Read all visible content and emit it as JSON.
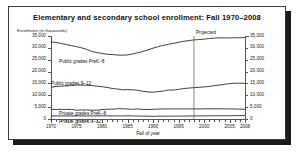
{
  "chart_data": {
    "type": "line",
    "title": "Elementary and secondary school enrollment: Fall 1970–2008",
    "ylabel": "Enrollment (in thousands)",
    "xlabel": "Fall of year",
    "xlim": [
      1970,
      2008
    ],
    "ylim": [
      0,
      35000
    ],
    "grid": false,
    "legend_position": "inline-labels",
    "dual_y_axis": true,
    "y_ticks": [
      0,
      5000,
      10000,
      15000,
      20000,
      25000,
      30000,
      35000
    ],
    "y_tick_labels": [
      "0",
      "5,000",
      "10,000",
      "15,000",
      "20,000",
      "25,000",
      "30,000",
      "35,000"
    ],
    "x_ticks": [
      1970,
      1975,
      1980,
      1985,
      1990,
      1995,
      2000,
      2005,
      2008
    ],
    "x_tick_labels": [
      "1970",
      "1975",
      "1980",
      "1985",
      "1990",
      "1995",
      "2000",
      "2005",
      "2008"
    ],
    "x_minor_tick_step": 1,
    "annotations": [
      {
        "name": "projected-divider",
        "label": "Projected",
        "x": 1998,
        "type": "vertical-line-with-label"
      }
    ],
    "x": [
      1970,
      1971,
      1972,
      1973,
      1974,
      1975,
      1976,
      1977,
      1978,
      1979,
      1980,
      1981,
      1982,
      1983,
      1984,
      1985,
      1986,
      1987,
      1988,
      1989,
      1990,
      1991,
      1992,
      1993,
      1994,
      1995,
      1996,
      1997,
      1998,
      1999,
      2000,
      2001,
      2002,
      2003,
      2004,
      2005,
      2006,
      2007,
      2008
    ],
    "series": [
      {
        "name": "Public grades PreK–8",
        "label": "Public grades PreK–8",
        "values": [
          32577,
          32265,
          31879,
          31401,
          30971,
          30515,
          29997,
          29375,
          28463,
          28034,
          27647,
          27280,
          27161,
          26981,
          26905,
          27034,
          27420,
          27933,
          28501,
          29152,
          29878,
          30506,
          31088,
          31504,
          31898,
          32341,
          32764,
          33073,
          33344,
          33486,
          33686,
          33936,
          34114,
          34201,
          34178,
          34204,
          34235,
          34286,
          34350
        ]
      },
      {
        "name": "Public grades 9–12",
        "label": "Public grades 9–12",
        "values": [
          13332,
          13753,
          13848,
          14002,
          14103,
          14304,
          14314,
          14203,
          14088,
          13855,
          13616,
          13298,
          12880,
          12639,
          12304,
          12388,
          12333,
          12076,
          11687,
          11390,
          11338,
          11541,
          11735,
          12213,
          12213,
          12500,
          12849,
          13054,
          13195,
          13369,
          13517,
          13736,
          14069,
          14338,
          14618,
          14909,
          15081,
          15086,
          15047
        ]
      },
      {
        "name": "Private grades PreK–8",
        "label": "Private grades PreK–8",
        "values": [
          4052,
          4052,
          4048,
          4045,
          4042,
          3700,
          3825,
          3797,
          3732,
          3700,
          3992,
          4100,
          4165,
          4315,
          4339,
          4195,
          4116,
          4232,
          4036,
          4035,
          4084,
          4190,
          4230,
          4250,
          4257,
          4256,
          4272,
          4250,
          4274,
          4235,
          4315,
          4300,
          4300,
          4285,
          4269,
          4260,
          4220,
          4150,
          4100
        ]
      },
      {
        "name": "Private grades 9–12",
        "label": "Private grades 9–12",
        "values": [
          1311,
          1311,
          1307,
          1305,
          1302,
          1300,
          1300,
          1300,
          1300,
          1300,
          1339,
          1300,
          1296,
          1300,
          1296,
          1362,
          1300,
          1247,
          1206,
          1196,
          1137,
          1200,
          1200,
          1213,
          1216,
          1226,
          1232,
          1270,
          1288,
          1305,
          1327,
          1340,
          1350,
          1350,
          1360,
          1380,
          1400,
          1420,
          1440
        ]
      }
    ],
    "series_label_positions": [
      {
        "name": "Public grades PreK–8",
        "x_px": 50,
        "y_px": 52
      },
      {
        "name": "Public grades 9–12",
        "x_px": 42,
        "y_px": 74
      },
      {
        "name": "Private grades PreK–8",
        "x_px": 50,
        "y_px": 104
      },
      {
        "name": "Private grades 9–12",
        "x_px": 50,
        "y_px": 112
      }
    ]
  }
}
